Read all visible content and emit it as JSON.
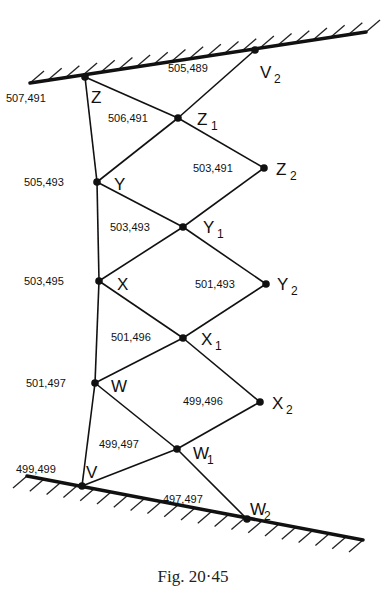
{
  "caption": "Fig. 20·45",
  "walls": {
    "top": {
      "x1": 30,
      "y1": 83,
      "x2": 366,
      "y2": 32
    },
    "bottom": {
      "x1": 27,
      "y1": 476,
      "x2": 363,
      "y2": 540
    }
  },
  "nodes": [
    {
      "id": "Z",
      "name": "Z",
      "sub": "",
      "x": 85,
      "y": 77,
      "value": "507,491",
      "vx": 6,
      "vy": 102,
      "lx": 91,
      "ly": 103
    },
    {
      "id": "V2",
      "name": "V",
      "sub": "2",
      "x": 255,
      "y": 50,
      "value": "505,489",
      "vx": 168,
      "vy": 72,
      "lx": 260,
      "ly": 78
    },
    {
      "id": "Z1",
      "name": "Z",
      "sub": "1",
      "x": 178,
      "y": 118,
      "value": "506,491",
      "vx": 108,
      "vy": 122,
      "lx": 197,
      "ly": 125
    },
    {
      "id": "Z2",
      "name": "Z",
      "sub": "2",
      "x": 264,
      "y": 168,
      "value": "503,491",
      "vx": 193,
      "vy": 172,
      "lx": 276,
      "ly": 175
    },
    {
      "id": "Y",
      "name": "Y",
      "sub": "",
      "x": 97,
      "y": 182,
      "value": "505,493",
      "vx": 24,
      "vy": 186,
      "lx": 114,
      "ly": 190
    },
    {
      "id": "Y1",
      "name": "Y",
      "sub": "1",
      "x": 183,
      "y": 227,
      "value": "503,493",
      "vx": 110,
      "vy": 231,
      "lx": 203,
      "ly": 233
    },
    {
      "id": "Y2",
      "name": "Y",
      "sub": "2",
      "x": 266,
      "y": 284,
      "value": "501,493",
      "vx": 195,
      "vy": 288,
      "lx": 277,
      "ly": 290
    },
    {
      "id": "X",
      "name": "X",
      "sub": "",
      "x": 99,
      "y": 281,
      "value": "503,495",
      "vx": 24,
      "vy": 285,
      "lx": 117,
      "ly": 290
    },
    {
      "id": "X1",
      "name": "X",
      "sub": "1",
      "x": 183,
      "y": 338,
      "value": "501,496",
      "vx": 111,
      "vy": 341,
      "lx": 201,
      "ly": 345
    },
    {
      "id": "X2",
      "name": "X",
      "sub": "2",
      "x": 260,
      "y": 402,
      "value": "499,496",
      "vx": 183,
      "vy": 405,
      "lx": 272,
      "ly": 409
    },
    {
      "id": "W",
      "name": "W",
      "sub": "",
      "x": 95,
      "y": 383,
      "value": "501,497",
      "vx": 26,
      "vy": 387,
      "lx": 111,
      "ly": 392
    },
    {
      "id": "W1",
      "name": "W",
      "sub": "1",
      "x": 177,
      "y": 449,
      "value": "499,497",
      "vx": 99,
      "vy": 448,
      "lx": 193,
      "ly": 459
    },
    {
      "id": "V",
      "name": "V",
      "sub": "",
      "x": 82,
      "y": 486,
      "value": "499,499",
      "vx": 16,
      "vy": 473,
      "lx": 86,
      "ly": 478
    },
    {
      "id": "W2",
      "name": "W",
      "sub": "2",
      "x": 247,
      "y": 519,
      "value": "497,497",
      "vx": 163,
      "vy": 503,
      "lx": 250,
      "ly": 515
    }
  ],
  "edges": [
    [
      "Z",
      "Y"
    ],
    [
      "Y",
      "X"
    ],
    [
      "X",
      "W"
    ],
    [
      "W",
      "V"
    ],
    [
      "Z",
      "Z1"
    ],
    [
      "Z1",
      "V2"
    ],
    [
      "Z1",
      "Y"
    ],
    [
      "Z1",
      "Z2"
    ],
    [
      "Y",
      "Y1"
    ],
    [
      "Y1",
      "Z2"
    ],
    [
      "Y1",
      "X"
    ],
    [
      "Y1",
      "Y2"
    ],
    [
      "X",
      "X1"
    ],
    [
      "X1",
      "Y2"
    ],
    [
      "X1",
      "W"
    ],
    [
      "X1",
      "X2"
    ],
    [
      "W",
      "W1"
    ],
    [
      "W1",
      "X2"
    ],
    [
      "W1",
      "V"
    ],
    [
      "W1",
      "W2"
    ]
  ]
}
